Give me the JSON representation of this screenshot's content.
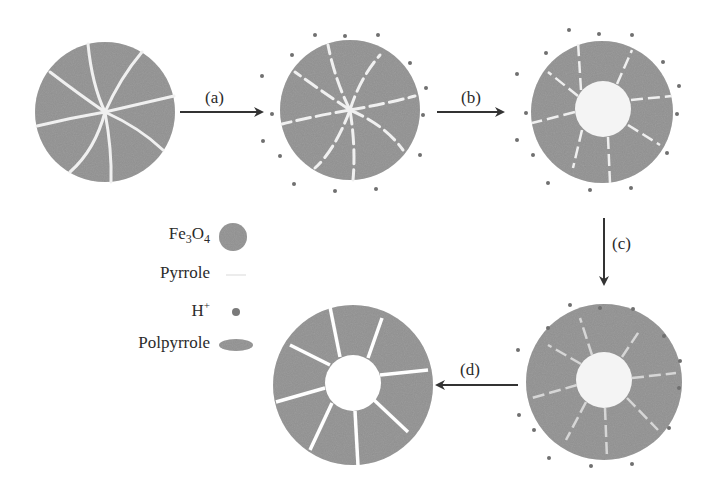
{
  "steps": {
    "a": {
      "label": "(a)"
    },
    "b": {
      "label": "(b)"
    },
    "c": {
      "label": "(c)"
    },
    "d": {
      "label": "(d)"
    }
  },
  "legend": {
    "items": [
      {
        "label": "Fe3O4",
        "symbol": "large-gray-circle",
        "base": "Fe",
        "sub1": "3",
        "mid": "O",
        "sub2": "4"
      },
      {
        "label": "Pyrrole",
        "symbol": "faint-white-dash"
      },
      {
        "label": "H+",
        "symbol": "small-gray-dot",
        "base": "H",
        "sup": "+"
      },
      {
        "label": "Polpyrrole",
        "symbol": "gray-ellipse"
      }
    ]
  },
  "stages": [
    {
      "id": "stage-1",
      "description": "Fe3O4 sphere with pyrrole-filled cracks"
    },
    {
      "id": "stage-2",
      "description": "Fe3O4 sphere with pyrrole and H+ ions around"
    },
    {
      "id": "stage-3",
      "description": "Hollow core forming, H+ ions surrounding"
    },
    {
      "id": "stage-4",
      "description": "Polypyrrole-coated hollow sphere with H+"
    },
    {
      "id": "stage-5",
      "description": "Hollow segmented polypyrrole sphere"
    }
  ],
  "colors": {
    "particle": "#8c8c8c",
    "crack": "#eeeeee",
    "dot": "#7a7a7a",
    "arrow": "#333333",
    "core": "#f2f2f2"
  }
}
